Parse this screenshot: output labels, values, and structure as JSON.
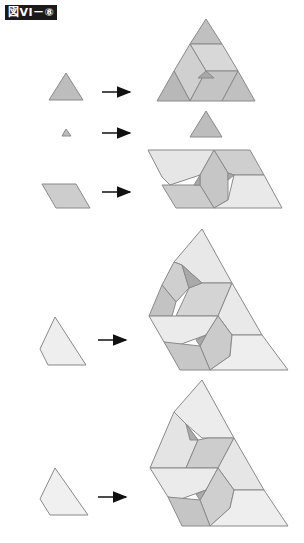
{
  "figure_label": "図VI－⑧",
  "colors": {
    "dark": "#b9b9b9",
    "mid": "#cdcdcd",
    "light": "#e4e4e4",
    "lighter": "#efefef",
    "edge": "#8a8a8a",
    "arrow": "#111111",
    "label_bg": "#1a1a1a"
  },
  "rows": [
    {
      "source_shape": "triangle",
      "arrow": "right-arrow",
      "result": "large triangle tiled with 3 corner triangles and 3 rhombi around a small center triangle"
    },
    {
      "source_shape": "small triangle",
      "arrow": "right-arrow",
      "result": "triangle"
    },
    {
      "source_shape": "rhombus",
      "arrow": "right-arrow",
      "result": "large rhombus tiled with rhombi"
    },
    {
      "source_shape": "trapezoid/kite quadrilateral",
      "arrow": "right-arrow",
      "result": "large quadrilateral tiled with rhombi and triangles"
    },
    {
      "source_shape": "trapezoid/kite quadrilateral",
      "arrow": "right-arrow",
      "result": "large quadrilateral tiled with rhombi and triangles"
    }
  ]
}
